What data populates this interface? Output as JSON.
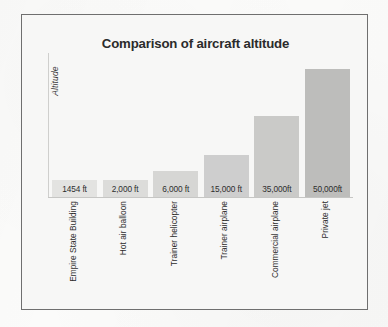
{
  "figure": {
    "title": "Comparison of aircraft altitude",
    "frame_border_color": "#6f6f6f",
    "background_color": "#f7f7f6"
  },
  "chart_data": {
    "type": "bar",
    "title": "Comparison of aircraft altitude",
    "xlabel": "",
    "ylabel": "Altitude",
    "grid": false,
    "legend": "none",
    "ylim": [
      0,
      50000
    ],
    "categories": [
      "Empire State Building",
      "Hot air balloon",
      "Trainer helicopter",
      "Trainer airplane",
      "Commercial airplane",
      "Private jet"
    ],
    "values": [
      1454,
      2000,
      6000,
      15000,
      35000,
      50000
    ],
    "value_labels": [
      "1454 ft",
      "2,000 ft",
      "6,000 ft",
      "15,000 ft",
      "35,000ft",
      "50,000ft"
    ],
    "bar_colors": [
      "#e3e3e1",
      "#dcdcda",
      "#d6d6d4",
      "#cecece",
      "#cacac8",
      "#bdbdbb"
    ],
    "bar_pixel_heights": [
      17,
      17,
      26,
      42,
      81,
      128
    ],
    "unit": "ft"
  }
}
